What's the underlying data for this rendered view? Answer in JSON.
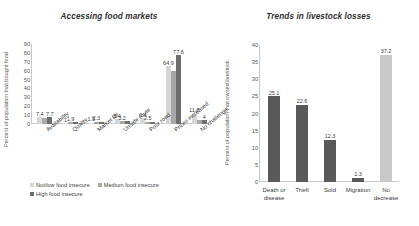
{
  "chart_data": [
    {
      "type": "bar",
      "title": "Accessing food markets",
      "xlabel": "",
      "ylabel": "Percent of population that bought food",
      "ylim": [
        0,
        90
      ],
      "yticks": [
        0,
        10,
        20,
        30,
        40,
        50,
        60,
        70,
        80,
        90
      ],
      "grid": false,
      "legend_position": "bottom-left",
      "categories": [
        "Availability",
        "Quality",
        "Market far",
        "Unsafe route",
        "Poor road",
        "Prices increased",
        "No challenge"
      ],
      "series": [
        {
          "name": "Not/low food insecure",
          "color": "#d6d6d6",
          "values": [
            7.4,
            1.0,
            1.5,
            5.4,
            6.4,
            64.9,
            11.8
          ]
        },
        {
          "name": "Medium food insecure",
          "color": "#a8a8a8",
          "values": [
            7.0,
            1.9,
            2.3,
            3.2,
            2.5,
            60.0,
            4.0
          ]
        },
        {
          "name": "High food insecure",
          "color": "#6e6e6e",
          "values": [
            7.7,
            1.9,
            2.3,
            3.2,
            2.5,
            77.6,
            4.0
          ]
        }
      ],
      "data_labels": [
        [
          "7.4",
          "",
          "7.7"
        ],
        [
          "1",
          "1.9",
          ""
        ],
        [
          "1.5",
          "2.3",
          ""
        ],
        [
          "5.4",
          "3.2",
          ""
        ],
        [
          "6.4",
          "2.5",
          ""
        ],
        [
          "64.9",
          "",
          "77.6"
        ],
        [
          "11.8",
          "",
          "4"
        ]
      ]
    },
    {
      "type": "bar",
      "title": "Trends in livestock losses",
      "xlabel": "",
      "ylabel": "Percent of population that owned livestock",
      "ylim": [
        0,
        40
      ],
      "yticks": [
        0,
        5,
        10,
        15,
        20,
        25,
        30,
        35,
        40
      ],
      "grid": false,
      "categories": [
        "Death or disease",
        "Theft",
        "Sold",
        "Migration",
        "No decrease"
      ],
      "values": [
        25.1,
        22.6,
        12.3,
        1.3,
        37.2
      ],
      "data_labels": [
        "25.1",
        "22.6",
        "12.3",
        "1.3",
        "37.2"
      ],
      "bar_colors": [
        "#595959",
        "#595959",
        "#595959",
        "#595959",
        "#c9c9c9"
      ]
    }
  ],
  "left_chart": {
    "title": "Accessing food markets",
    "ylabel": "Percent of population that bought food",
    "yticks": [
      "90",
      "80",
      "70",
      "60",
      "50",
      "40",
      "30",
      "20",
      "10",
      "0"
    ],
    "categories": [
      "Availability",
      "Quality",
      "Market far",
      "Unsafe route",
      "Poor road",
      "Prices increased",
      "No challenge"
    ],
    "legend": [
      {
        "label": "Not/low food insecure",
        "color": "#d6d6d6"
      },
      {
        "label": "Medium food insecure",
        "color": "#a8a8a8"
      },
      {
        "label": "High food insecure",
        "color": "#6e6e6e"
      }
    ]
  },
  "right_chart": {
    "title": "Trends in livestock losses",
    "ylabel": "Percent of population that owned livestock",
    "yticks": [
      "40",
      "35",
      "30",
      "25",
      "20",
      "15",
      "10",
      "5",
      "0"
    ],
    "categories": [
      "Death or",
      "disease",
      "Theft",
      "Sold",
      "Migration",
      "No",
      "decrease"
    ]
  }
}
